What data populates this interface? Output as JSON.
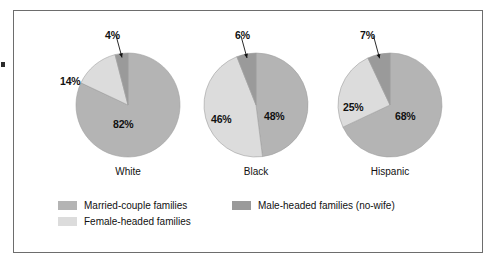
{
  "chart_data": {
    "type": "pie",
    "title": "",
    "subtitle": "",
    "xlabel": "",
    "ylabel": "",
    "legend_position": "bottom-left",
    "grid": false,
    "units": "percent",
    "categories": [
      "Married-couple families",
      "Female-headed families",
      "Male-headed families (no-wife)"
    ],
    "charts": [
      {
        "name": "White",
        "group_label": "White",
        "slices": [
          {
            "category": "Married-couple families",
            "value": 82,
            "label": "82%",
            "color": "#b4b4b4",
            "callout": false
          },
          {
            "category": "Female-headed families",
            "value": 14,
            "label": "14%",
            "color": "#dcdcdc",
            "callout": false
          },
          {
            "category": "Male-headed families (no-wife)",
            "value": 4,
            "label": "4%",
            "color": "#9a9a9a",
            "callout": true
          }
        ]
      },
      {
        "name": "Black",
        "group_label": "Black",
        "slices": [
          {
            "category": "Married-couple families",
            "value": 48,
            "label": "48%",
            "color": "#b4b4b4",
            "callout": false
          },
          {
            "category": "Female-headed families",
            "value": 46,
            "label": "46%",
            "color": "#dcdcdc",
            "callout": false
          },
          {
            "category": "Male-headed families (no-wife)",
            "value": 6,
            "label": "6%",
            "color": "#9a9a9a",
            "callout": true
          }
        ]
      },
      {
        "name": "Hispanic",
        "group_label": "Hispanic",
        "slices": [
          {
            "category": "Married-couple families",
            "value": 68,
            "label": "68%",
            "color": "#b4b4b4",
            "callout": false
          },
          {
            "category": "Female-headed families",
            "value": 25,
            "label": "25%",
            "color": "#dcdcdc",
            "callout": false
          },
          {
            "category": "Male-headed families (no-wife)",
            "value": 7,
            "label": "7%",
            "color": "#9a9a9a",
            "callout": true
          }
        ]
      }
    ]
  },
  "legend": {
    "items": [
      {
        "label": "Married-couple families",
        "color": "#b4b4b4"
      },
      {
        "label": "Male-headed families (no-wife)",
        "color": "#9a9a9a"
      },
      {
        "label": "Female-headed families",
        "color": "#dcdcdc"
      }
    ]
  },
  "colors": {
    "married": "#b4b4b4",
    "male_headed": "#9a9a9a",
    "female_headed": "#dcdcdc",
    "frame_border": "#6d6d6d",
    "text": "#111111",
    "background": "#ffffff"
  },
  "pie_geometry": [
    {
      "cx": 128,
      "cy": 105,
      "r": 52
    },
    {
      "cx": 256,
      "cy": 105,
      "r": 52
    },
    {
      "cx": 390,
      "cy": 105,
      "r": 52
    }
  ],
  "label_positions": {
    "white": {
      "s0": {
        "x": 113,
        "y": 118
      },
      "s1": {
        "x": 66,
        "y": 76
      },
      "s2": {
        "x": 108,
        "y": 31
      },
      "group": {
        "x": 128,
        "y": 165
      }
    },
    "black": {
      "s0": {
        "x": 256,
        "y": 105
      },
      "s1": {
        "x": 209,
        "y": 110
      },
      "s2": {
        "x": 237,
        "y": 31
      },
      "group": {
        "x": 256,
        "y": 165
      }
    },
    "hispanic": {
      "s0": {
        "x": 384,
        "y": 110
      },
      "s1": {
        "x": 340,
        "y": 101
      },
      "s2": {
        "x": 363,
        "y": 31
      },
      "group": {
        "x": 390,
        "y": 165
      }
    }
  }
}
